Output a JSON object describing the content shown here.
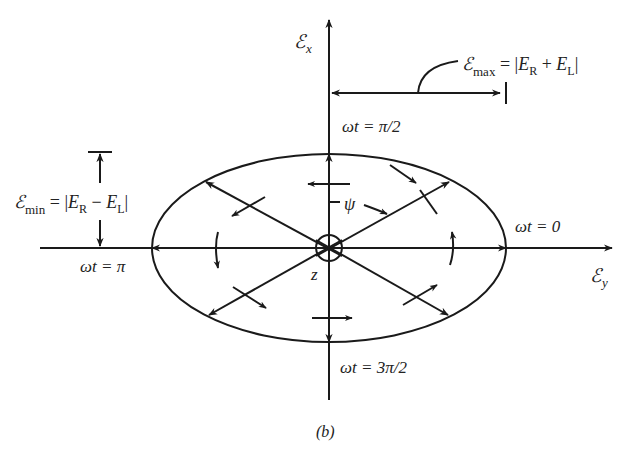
{
  "figure": {
    "caption": "(b)",
    "axes": {
      "vertical_label": "ℰ",
      "vertical_sub": "x",
      "horizontal_label": "ℰ",
      "horizontal_sub": "y",
      "origin_label": "z"
    },
    "annotations": {
      "emax": {
        "symbol": "ℰ",
        "sub": "max",
        "expr_pre": " = |",
        "E1": "E",
        "E1sub": "R",
        "op": " + ",
        "E2": "E",
        "E2sub": "L",
        "expr_post": "|"
      },
      "emin": {
        "symbol": "ℰ",
        "sub": "min",
        "expr_pre": " = |",
        "E1": "E",
        "E1sub": "R",
        "op": " − ",
        "E2": "E",
        "E2sub": "L",
        "expr_post": "|"
      },
      "psi": "ψ"
    },
    "phase_labels": {
      "top": "ωt = π/2",
      "right": "ωt = 0",
      "left": "ωt = π",
      "bottom": "ωt = 3π/2"
    },
    "stroke_color": "#1a1a1a"
  }
}
